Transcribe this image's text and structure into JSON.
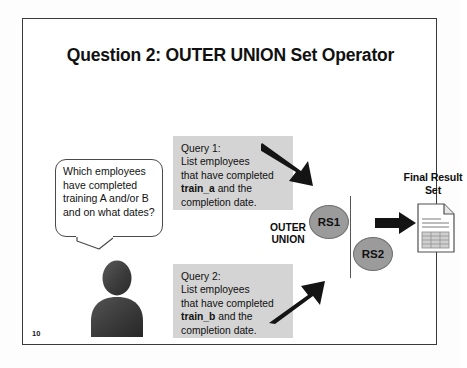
{
  "slide": {
    "title": "Question 2: OUTER UNION Set Operator",
    "number": "10",
    "background_color": "#ffffff",
    "border_color": "#3a3a3a"
  },
  "speech_bubble": {
    "name": "user-question-bubble",
    "text": "Which employees have completed training A and/or B and on what dates?"
  },
  "person": {
    "name": "user-avatar-silhouette",
    "color": "#3b3b3b"
  },
  "queries": [
    {
      "id": "query-1",
      "heading": "Query 1:",
      "line_1": "List employees",
      "line_2": "that have completed",
      "term": "train_a",
      "line_3_suffix": " and the",
      "line_4": "completion date.",
      "background_color": "#d4d4d4"
    },
    {
      "id": "query-2",
      "heading": "Query 2:",
      "line_1": "List employees",
      "line_2": "that have completed",
      "term": "train_b",
      "line_3_suffix": " and the",
      "line_4": "completion date.",
      "background_color": "#d4d4d4"
    }
  ],
  "operator": {
    "line_1": "OUTER",
    "line_2": "UNION"
  },
  "result_sets": [
    {
      "id": "rs1",
      "label": "RS1",
      "fill_color": "#9b9b9b"
    },
    {
      "id": "rs2",
      "label": "RS2",
      "fill_color": "#9b9b9b"
    }
  ],
  "final_result": {
    "line_1": "Final Result",
    "line_2": "Set",
    "icon": "document-table-icon"
  },
  "arrows": [
    {
      "id": "arrow-query1-to-rs1",
      "direction": "down-right",
      "color": "#141414"
    },
    {
      "id": "arrow-query2-to-rs2",
      "direction": "up-right",
      "color": "#141414"
    },
    {
      "id": "arrow-rs-to-final",
      "direction": "right",
      "color": "#141414"
    }
  ]
}
